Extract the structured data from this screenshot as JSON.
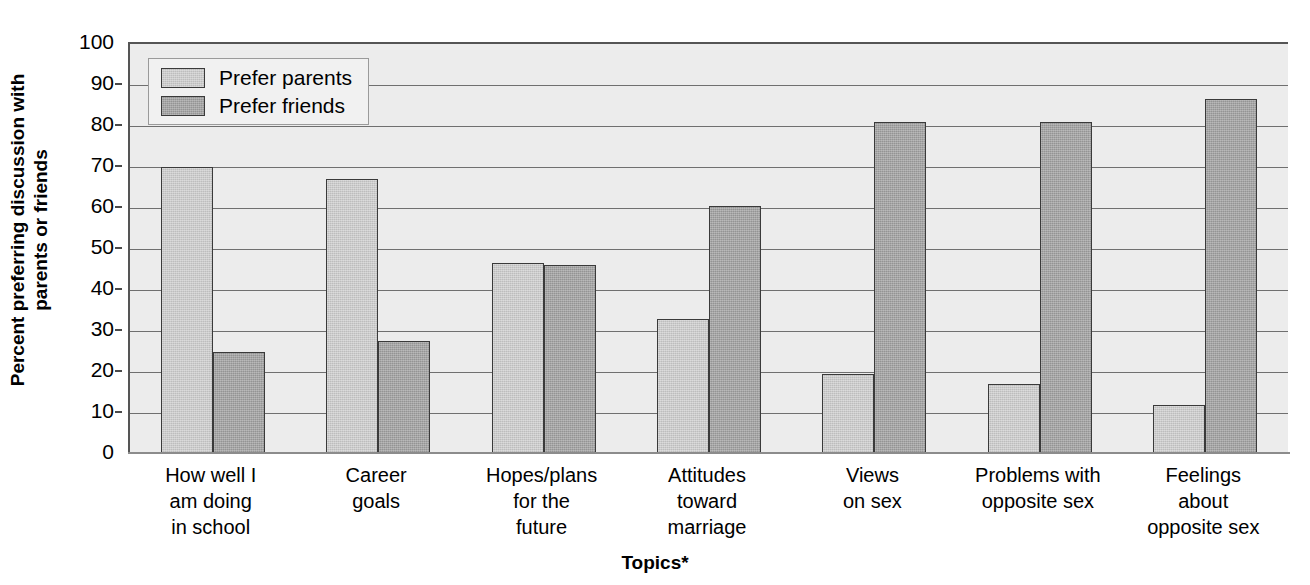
{
  "chart_data": {
    "type": "bar",
    "title": "",
    "subtitle": "",
    "xlabel": "Topics*",
    "ylabel": "Percent preferring discussion with parents or friends",
    "ylabel_line1": "Percent preferring discussion with",
    "ylabel_line2": "parents or friends",
    "ylim": [
      0,
      100
    ],
    "ytick_step": 10,
    "yticks": [
      0,
      10,
      20,
      30,
      40,
      50,
      60,
      70,
      80,
      90,
      100
    ],
    "ytick_labels": [
      "0",
      "10",
      "20",
      "30",
      "40",
      "50",
      "60",
      "70",
      "80",
      "90",
      "100"
    ],
    "grid": true,
    "grid_axis": "y",
    "legend_position": "top-left",
    "categories": [
      "How well I am doing in school",
      "Career goals",
      "Hopes/plans for the future",
      "Attitudes toward marriage",
      "Views on sex",
      "Problems with opposite sex",
      "Feelings about opposite sex"
    ],
    "category_lines": [
      [
        "How well I",
        "am doing",
        "in school"
      ],
      [
        "Career",
        "goals"
      ],
      [
        "Hopes/plans",
        "for the",
        "future"
      ],
      [
        "Attitudes",
        "toward",
        "marriage"
      ],
      [
        "Views",
        "on sex"
      ],
      [
        "Problems with",
        "opposite sex"
      ],
      [
        "Feelings",
        "about",
        "opposite sex"
      ]
    ],
    "series": [
      {
        "name": "Prefer parents",
        "color": "#bdbdbd",
        "values": [
          70,
          67,
          46.5,
          33,
          19.5,
          17,
          12
        ]
      },
      {
        "name": "Prefer friends",
        "color": "#949494",
        "values": [
          25,
          27.5,
          46,
          60.5,
          81,
          81,
          86.5
        ]
      }
    ]
  },
  "legend": {
    "items": [
      {
        "label": "Prefer parents",
        "swatch": "parents"
      },
      {
        "label": "Prefer friends",
        "swatch": "friends"
      }
    ]
  },
  "colors": {
    "plot_background": "#ececec",
    "gridline": "#6f6f6f",
    "axis": "#555555",
    "bar_parents": "#bdbdbd",
    "bar_friends": "#949494",
    "bar_outline": "#3a3a3a",
    "text": "#000000"
  }
}
